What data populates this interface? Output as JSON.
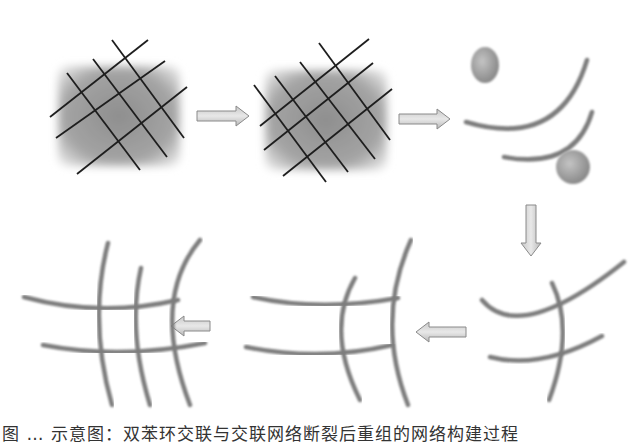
{
  "figure": {
    "caption": "图 … 示意图：双苯环交联与交联网络断裂后重组的网络构建过程",
    "caption_visible": "partially clipped at bottom edge",
    "colors": {
      "background": "#ffffff",
      "square_fill": "#9a9a9a",
      "grid_line": "#1e1e1e",
      "fiber": "#7d7d7d",
      "sphere": "#a8a8a8",
      "arrow_fill": "#d6d6d6",
      "arrow_stroke": "#8a8a8a"
    },
    "panels": [
      {
        "id": 1,
        "label": "crosslinked-grid-on-square",
        "position": "top-left"
      },
      {
        "id": 2,
        "label": "crosslinked-grid-on-square-rotated",
        "position": "top-middle"
      },
      {
        "id": 3,
        "label": "separated-arcs-with-particles",
        "position": "top-right"
      },
      {
        "id": 4,
        "label": "two-arcs-crossed-by-one-fiber",
        "position": "bottom-right"
      },
      {
        "id": 5,
        "label": "two-arcs-crossed-by-two-fibers",
        "position": "bottom-middle"
      },
      {
        "id": 6,
        "label": "full-fiber-grid",
        "position": "bottom-left"
      }
    ],
    "arrows": [
      {
        "from": 1,
        "to": 2,
        "direction": "right"
      },
      {
        "from": 2,
        "to": 3,
        "direction": "right"
      },
      {
        "from": 3,
        "to": 4,
        "direction": "down"
      },
      {
        "from": 4,
        "to": 5,
        "direction": "left"
      },
      {
        "from": 5,
        "to": 6,
        "direction": "left"
      }
    ]
  }
}
